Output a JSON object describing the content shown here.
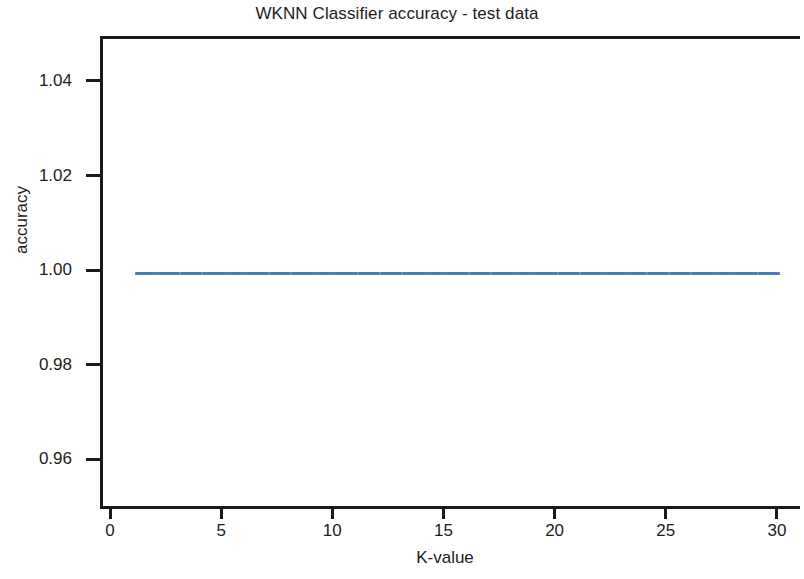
{
  "chart_data": {
    "type": "line",
    "title": "WKNN Classifier accuracy - test data",
    "xlabel": "K-value",
    "ylabel": "accuracy",
    "xlim": [
      0,
      30.8
    ],
    "ylim": [
      0.9495,
      1.0495
    ],
    "xticks": [
      0,
      5,
      10,
      15,
      20,
      25,
      30
    ],
    "xtick_labels": [
      "0",
      "5",
      "10",
      "15",
      "20",
      "25",
      "30"
    ],
    "yticks": [
      0.96,
      0.98,
      1.0,
      1.02,
      1.04
    ],
    "ytick_labels": [
      "0.96",
      "0.98",
      "1.00",
      "1.02",
      "1.04"
    ],
    "grid": false,
    "legend": false,
    "line_color": "#4a7ebb",
    "axis_color": "#1a1a1a",
    "background_color": "#ffffff",
    "series": [
      {
        "name": "test accuracy",
        "x": [
          1,
          2,
          3,
          4,
          5,
          6,
          7,
          8,
          9,
          10,
          11,
          12,
          13,
          14,
          15,
          16,
          17,
          18,
          19,
          20,
          21,
          22,
          23,
          24,
          25,
          26,
          27,
          28,
          29,
          30
        ],
        "values": [
          1.0,
          1.0,
          1.0,
          1.0,
          1.0,
          1.0,
          1.0,
          1.0,
          1.0,
          1.0,
          1.0,
          1.0,
          1.0,
          1.0,
          1.0,
          1.0,
          1.0,
          1.0,
          1.0,
          1.0,
          1.0,
          1.0,
          1.0,
          1.0,
          1.0,
          1.0,
          1.0,
          1.0,
          1.0,
          1.0
        ]
      }
    ]
  }
}
